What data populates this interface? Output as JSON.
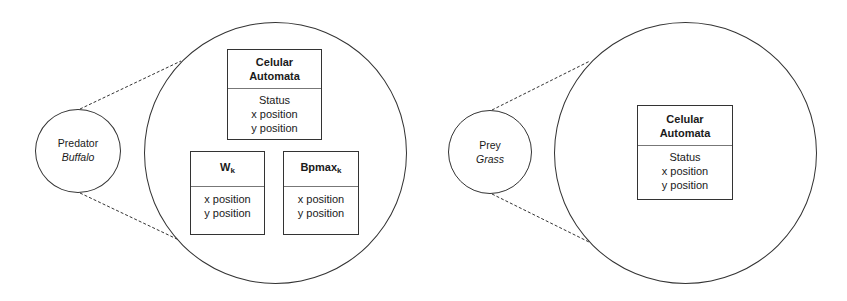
{
  "left_panel": {
    "agent": {
      "role": "Predator",
      "species": "Buffalo"
    },
    "cellular_automata": {
      "title_line1": "Celular",
      "title_line2": "Automata",
      "attributes": [
        "Status",
        "x position",
        "y position"
      ]
    },
    "wk": {
      "title": "W",
      "subscript": "k",
      "attributes": [
        "x position",
        "y position"
      ]
    },
    "bpmax": {
      "title": "Bpmax",
      "subscript": "k",
      "attributes": [
        "x position",
        "y position"
      ]
    }
  },
  "right_panel": {
    "agent": {
      "role": "Prey",
      "species": "Grass"
    },
    "cellular_automata": {
      "title_line1": "Celular",
      "title_line2": "Automata",
      "attributes": [
        "Status",
        "x position",
        "y position"
      ]
    }
  }
}
